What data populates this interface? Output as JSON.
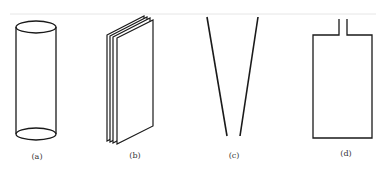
{
  "figure": {
    "panels": [
      {
        "id": "a",
        "label": "(a)",
        "shape": "cylinder"
      },
      {
        "id": "b",
        "label": "(b)",
        "shape": "stacked-plates"
      },
      {
        "id": "c",
        "label": "(c)",
        "shape": "converging-lines"
      },
      {
        "id": "d",
        "label": "(d)",
        "shape": "vessel-with-neck"
      }
    ],
    "colors": {
      "line": "#1a1a1a",
      "background": "#ffffff",
      "rule": "#e6e6e6"
    }
  }
}
